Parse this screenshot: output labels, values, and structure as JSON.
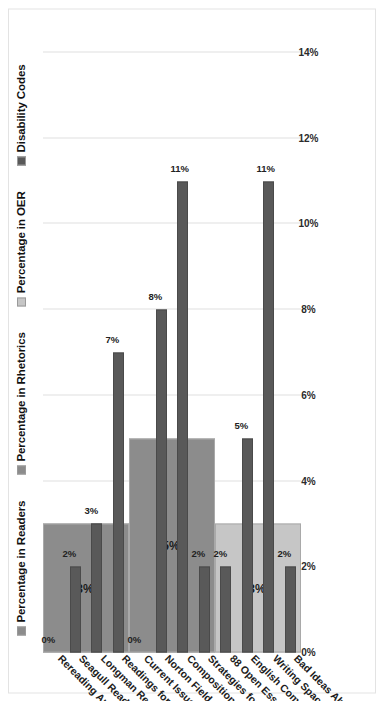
{
  "chart_data": {
    "type": "bar",
    "orientation": "horizontal-rotated",
    "title": "",
    "xlabel": "",
    "ylabel": "",
    "xlim": [
      0,
      14
    ],
    "grid": true,
    "legend_position": "top",
    "xticks": [
      "0%",
      "2%",
      "4%",
      "6%",
      "8%",
      "10%",
      "12%",
      "14%"
    ],
    "xtick_values": [
      0,
      2,
      4,
      6,
      8,
      10,
      12,
      14
    ],
    "categories": [
      "Rereading America",
      "Seagull Reader: Essays",
      "Longman Reader",
      "Readings for Writers",
      "Current Issues and Enduring Questions",
      "Norton Field Guide to Writing with Readings",
      "Composition of Everyday Life",
      "Strategies for Successful Writing",
      "88 Open Essays",
      "English Composition 1: Rhetorical Methods...",
      "Writing Spaces",
      "Bad Ideas About Writing"
    ],
    "series": [
      {
        "name": "Percentage in Readers",
        "color": "#8c8c8c",
        "group_label": "3%",
        "group_value": 3,
        "category_span": [
          0,
          3
        ],
        "values": [
          3,
          3,
          3,
          3,
          null,
          null,
          null,
          null,
          null,
          null,
          null,
          null
        ]
      },
      {
        "name": "Percentage in Rhetorics",
        "color": "#8c8c8c",
        "group_label": "5%",
        "group_value": 5,
        "category_span": [
          4,
          7
        ],
        "values": [
          null,
          null,
          null,
          null,
          5,
          5,
          5,
          5,
          null,
          null,
          null,
          null
        ]
      },
      {
        "name": "Percentage in OER",
        "color": "#c6c6c6",
        "group_label": "3%",
        "group_value": 3,
        "category_span": [
          8,
          11
        ],
        "values": [
          null,
          null,
          null,
          null,
          null,
          null,
          null,
          null,
          3,
          3,
          3,
          3
        ]
      },
      {
        "name": "Disability Codes",
        "color": "#595959",
        "values": [
          0,
          2,
          3,
          7,
          0,
          8,
          11,
          2,
          2,
          5,
          11,
          2
        ],
        "labels": [
          "0%",
          "2%",
          "3%",
          "7%",
          "0%",
          "8%",
          "11%",
          "2%",
          "2%",
          "5%",
          "11%",
          "2%"
        ]
      }
    ]
  },
  "legend": {
    "items": [
      {
        "label": "Percentage in Readers",
        "color": "#8c8c8c"
      },
      {
        "label": "Percentage in Rhetorics",
        "color": "#8c8c8c"
      },
      {
        "label": "Percentage in OER",
        "color": "#c6c6c6"
      },
      {
        "label": "Disability Codes",
        "color": "#595959"
      }
    ]
  }
}
